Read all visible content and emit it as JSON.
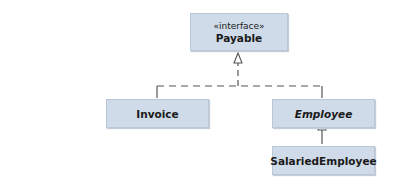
{
  "diagram": {
    "type": "UML class diagram",
    "nodes": {
      "payable": {
        "stereotype": "«interface»",
        "name": "Payable"
      },
      "invoice": {
        "name": "Invoice"
      },
      "employee": {
        "name": "Employee",
        "abstract": true
      },
      "salaried": {
        "name": "SalariedEmployee"
      }
    },
    "edges": [
      {
        "from": "Invoice",
        "to": "Payable",
        "kind": "realization"
      },
      {
        "from": "Employee",
        "to": "Payable",
        "kind": "realization"
      },
      {
        "from": "SalariedEmployee",
        "to": "Employee",
        "kind": "generalization"
      }
    ],
    "colors": {
      "box_fill": "#cfdbe8",
      "line": "#555555"
    }
  }
}
